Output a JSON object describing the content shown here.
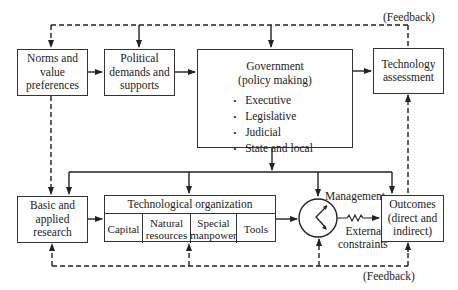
{
  "diagram": {
    "type": "flow-diagram",
    "feedback_top_label": "(Feedback)",
    "feedback_bottom_label": "(Feedback)",
    "nodes": {
      "norms": {
        "lines": [
          "Norms and",
          "value",
          "preferences"
        ]
      },
      "political": {
        "lines": [
          "Political",
          "demands and",
          "supports"
        ]
      },
      "government": {
        "title_lines": [
          "Government",
          "(policy making)"
        ],
        "items": [
          "Executive",
          "Legislative",
          "Judicial",
          "State and local"
        ]
      },
      "tech_assessment": {
        "lines": [
          "Technology",
          "assessment"
        ]
      },
      "basic_research": {
        "lines": [
          "Basic and",
          "applied",
          "research"
        ]
      },
      "tech_org": {
        "title": "Technological organization",
        "cells": [
          {
            "lines": [
              "Capital"
            ]
          },
          {
            "lines": [
              "Natural",
              "resources"
            ]
          },
          {
            "lines": [
              "Special",
              "manpower"
            ]
          },
          {
            "lines": [
              "Tools"
            ]
          }
        ]
      },
      "management": {
        "label": "Management"
      },
      "external": {
        "lines": [
          "External",
          "constraints"
        ]
      },
      "outcomes": {
        "lines": [
          "Outcomes",
          "(direct and",
          "indirect)"
        ]
      }
    },
    "edges": [
      {
        "from": "norms",
        "to": "political",
        "style": "solid"
      },
      {
        "from": "political",
        "to": "government",
        "style": "solid"
      },
      {
        "from": "government",
        "to": "tech_assessment",
        "style": "solid"
      },
      {
        "from": "government",
        "to": "basic_research",
        "style": "solid"
      },
      {
        "from": "government",
        "to": "tech_org",
        "style": "solid"
      },
      {
        "from": "government",
        "to": "management",
        "style": "solid"
      },
      {
        "from": "government",
        "to": "outcomes",
        "style": "solid"
      },
      {
        "from": "basic_research",
        "to": "tech_org",
        "style": "solid"
      },
      {
        "from": "tech_org",
        "to": "management",
        "style": "solid"
      },
      {
        "from": "management",
        "to": "outcomes",
        "style": "solid",
        "note": "via external constraints (zigzag)"
      },
      {
        "from": "tech_assessment",
        "to": "norms",
        "style": "dashed",
        "label": "(Feedback)"
      },
      {
        "from": "tech_assessment",
        "to": "political",
        "style": "dashed"
      },
      {
        "from": "tech_assessment",
        "to": "government",
        "style": "dashed"
      },
      {
        "from": "outcomes",
        "to": "tech_assessment",
        "style": "dashed"
      },
      {
        "from": "norms",
        "to": "basic_research",
        "style": "dashed"
      },
      {
        "from": "outcomes",
        "to": "basic_research",
        "style": "dashed",
        "label": "(Feedback)"
      },
      {
        "from": "outcomes",
        "to": "tech_org",
        "style": "dashed"
      },
      {
        "from": "outcomes",
        "to": "management",
        "style": "dashed"
      }
    ]
  }
}
